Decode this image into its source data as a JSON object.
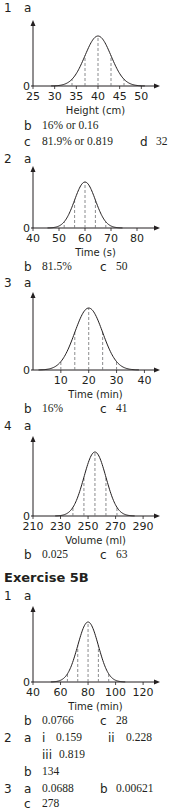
{
  "section1": {
    "q1": {
      "number": "1",
      "part_a": "a",
      "b_label": "b",
      "b_answer": "16% or 0.16",
      "c_label": "c",
      "c_answer": "81.9% or 0.819",
      "d_label": "d",
      "d_answer": "32"
    },
    "q2": {
      "number": "2",
      "part_a": "a",
      "b_label": "b",
      "b_answer": "81.5%",
      "c_label": "c",
      "c_answer": "50"
    },
    "q3": {
      "number": "3",
      "part_a": "a",
      "b_label": "b",
      "b_answer": "16%",
      "c_label": "c",
      "c_answer": "41"
    },
    "q4": {
      "number": "4",
      "part_a": "a",
      "b_label": "b",
      "b_answer": "0.025",
      "c_label": "c",
      "c_answer": "63"
    }
  },
  "exercise": {
    "title": "Exercise 5B",
    "q1": {
      "number": "1",
      "part_a": "a",
      "b_label": "b",
      "b_answer": "0.0766",
      "c_label": "c",
      "c_answer": "28"
    },
    "q2": {
      "number": "2",
      "part_a": "a",
      "i_label": "i",
      "i_answer": "0.159",
      "ii_label": "ii",
      "ii_answer": "0.228",
      "iii_label": "iii",
      "iii_answer": "0.819",
      "b_label": "b",
      "b_answer": "134"
    },
    "q3": {
      "number": "3",
      "a_label": "a",
      "a_answer": "0.0688",
      "b_label": "b",
      "b_answer": "0.00621",
      "c_label": "c",
      "c_answer": "278"
    }
  },
  "chart_data": [
    {
      "type": "line",
      "title": "Normal distribution",
      "xlabel": "Height (cm)",
      "ylabel": "",
      "x_ticks": [
        25,
        30,
        35,
        40,
        45,
        50
      ],
      "xlim": [
        25,
        52
      ],
      "origin_label": "0",
      "mean": 40,
      "sd": 3,
      "dashed_lines": [
        34,
        37,
        40,
        43,
        46
      ],
      "grid": false
    },
    {
      "type": "line",
      "title": "Normal distribution",
      "xlabel": "Time (s)",
      "ylabel": "",
      "x_ticks": [
        40,
        50,
        60,
        70,
        80
      ],
      "xlim": [
        40,
        85
      ],
      "origin_label": "0",
      "mean": 60,
      "sd": 4,
      "dashed_lines": [
        52,
        56,
        60,
        64,
        68
      ],
      "grid": false
    },
    {
      "type": "line",
      "title": "Normal distribution",
      "xlabel": "Time (min)",
      "ylabel": "",
      "x_ticks": [
        10,
        20,
        30,
        40
      ],
      "xlim": [
        0,
        42
      ],
      "origin_label": "0",
      "mean": 20,
      "sd": 5,
      "dashed_lines": [
        10,
        15,
        20,
        25,
        30
      ],
      "grid": false
    },
    {
      "type": "line",
      "title": "Normal distribution",
      "xlabel": "Volume (ml)",
      "ylabel": "",
      "x_ticks": [
        210,
        230,
        250,
        270,
        290
      ],
      "xlim": [
        210,
        295
      ],
      "origin_label": "0",
      "mean": 255,
      "sd": 8,
      "dashed_lines": [
        231,
        239,
        247,
        255,
        263,
        271,
        279
      ],
      "grid": false
    },
    {
      "type": "line",
      "title": "Normal distribution",
      "xlabel": "Time (min)",
      "ylabel": "",
      "x_ticks": [
        40,
        60,
        80,
        100,
        120
      ],
      "xlim": [
        40,
        125
      ],
      "origin_label": "0",
      "mean": 80,
      "sd": 7.5,
      "dashed_lines": [
        57.5,
        65,
        72.5,
        80,
        87.5,
        95,
        102.5
      ],
      "grid": false
    }
  ]
}
